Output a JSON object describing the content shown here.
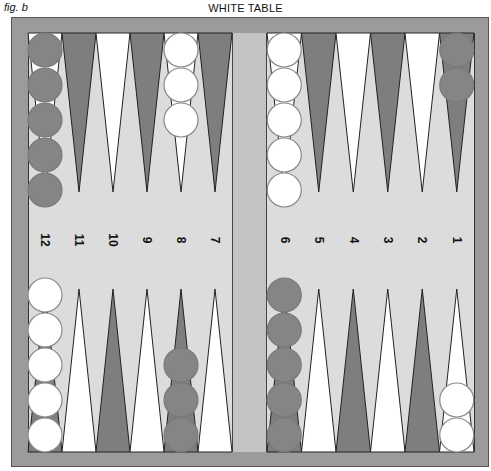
{
  "figure": {
    "label": "fig. b",
    "title": "WHITE TABLE"
  },
  "colors": {
    "frame": "#9b9b9b",
    "board": "#dcdcdc",
    "bar": "#c3c3c3",
    "dark_point": "#7e7e7e",
    "light_point": "#ffffff",
    "dark_checker": "#858585",
    "white_checker": "#ffffff"
  },
  "point_numbers": {
    "left": [
      "12",
      "11",
      "10",
      "9",
      "8",
      "7"
    ],
    "right": [
      "6",
      "5",
      "4",
      "3",
      "2",
      "1"
    ]
  },
  "top_points": [
    {
      "number": "12",
      "color": "light",
      "checkers": 5,
      "checker_color": "dark"
    },
    {
      "number": "11",
      "color": "dark",
      "checkers": 0
    },
    {
      "number": "10",
      "color": "light",
      "checkers": 0
    },
    {
      "number": "9",
      "color": "dark",
      "checkers": 0
    },
    {
      "number": "8",
      "color": "light",
      "checkers": 3,
      "checker_color": "white"
    },
    {
      "number": "7",
      "color": "dark",
      "checkers": 0
    },
    {
      "number": "6",
      "color": "light",
      "checkers": 5,
      "checker_color": "white"
    },
    {
      "number": "5",
      "color": "dark",
      "checkers": 0
    },
    {
      "number": "4",
      "color": "light",
      "checkers": 0
    },
    {
      "number": "3",
      "color": "dark",
      "checkers": 0
    },
    {
      "number": "2",
      "color": "light",
      "checkers": 0
    },
    {
      "number": "1",
      "color": "dark",
      "checkers": 2,
      "checker_color": "dark"
    }
  ],
  "bottom_points": [
    {
      "color": "dark",
      "checkers": 5,
      "checker_color": "white"
    },
    {
      "color": "light",
      "checkers": 0
    },
    {
      "color": "dark",
      "checkers": 0
    },
    {
      "color": "light",
      "checkers": 0
    },
    {
      "color": "dark",
      "checkers": 3,
      "checker_color": "dark"
    },
    {
      "color": "light",
      "checkers": 0
    },
    {
      "color": "dark",
      "checkers": 5,
      "checker_color": "dark"
    },
    {
      "color": "light",
      "checkers": 0
    },
    {
      "color": "dark",
      "checkers": 0
    },
    {
      "color": "light",
      "checkers": 0
    },
    {
      "color": "dark",
      "checkers": 0
    },
    {
      "color": "light",
      "checkers": 2,
      "checker_color": "white"
    }
  ]
}
